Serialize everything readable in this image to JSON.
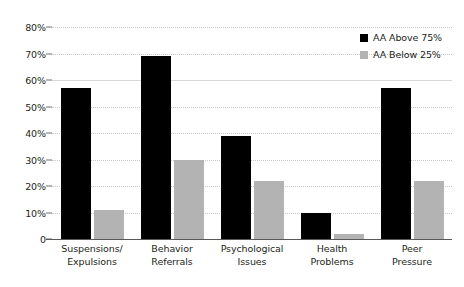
{
  "chart_data": {
    "type": "bar",
    "title": "",
    "subtitle": "",
    "xlabel": "",
    "ylabel": "",
    "categories": [
      "Suspensions/ Expulsions",
      "Behavior Referrals",
      "Psychological Issues",
      "Health Problems",
      "Peer Pressure"
    ],
    "category_lines": [
      [
        "Suspensions/",
        "Expulsions"
      ],
      [
        "Behavior",
        "Referrals"
      ],
      [
        "Psychological",
        "Issues"
      ],
      [
        "Health",
        "Problems"
      ],
      [
        "Peer",
        "Pressure"
      ]
    ],
    "series": [
      {
        "name": "AA Above 75%",
        "color": "#000000",
        "values": [
          57,
          69,
          39,
          10,
          57
        ]
      },
      {
        "name": "AA Below 25%",
        "color": "#b3b3b3",
        "values": [
          11,
          30,
          22,
          2,
          22
        ]
      }
    ],
    "ylim": [
      0,
      80
    ],
    "ytick_values": [
      0,
      10,
      20,
      30,
      40,
      50,
      60,
      70,
      80
    ],
    "ytick_labels": [
      "0",
      "10%",
      "20%",
      "30%",
      "40%",
      "50%",
      "60%",
      "70%",
      "80%"
    ],
    "grid": true,
    "legend_position": "top-right",
    "legend_entries": [
      "AA Above 75%",
      "AA Below 25%"
    ]
  }
}
